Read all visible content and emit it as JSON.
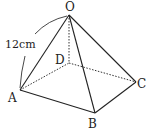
{
  "figure": {
    "type": "square pyramid",
    "vertices": {
      "O": {
        "label": "O",
        "x": 69,
        "y": 15
      },
      "A": {
        "label": "A",
        "x": 20,
        "y": 90
      },
      "B": {
        "label": "B",
        "x": 95,
        "y": 113
      },
      "C": {
        "label": "C",
        "x": 136,
        "y": 82
      },
      "D": {
        "label": "D",
        "x": 69,
        "y": 63
      }
    },
    "edges_visible": [
      "OA",
      "OB",
      "OC",
      "AB",
      "BC"
    ],
    "edges_hidden": [
      "OD",
      "AD",
      "DC"
    ],
    "measurement": {
      "label": "12cm",
      "between": "OA"
    }
  }
}
